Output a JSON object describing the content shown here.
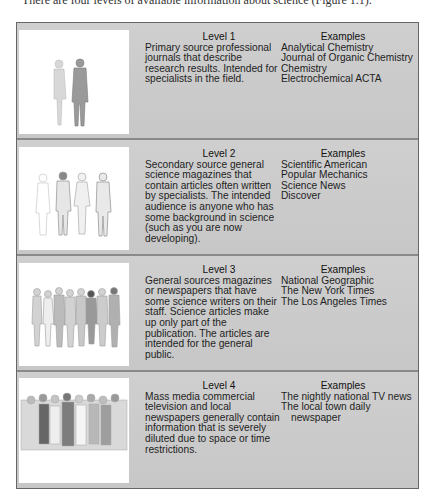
{
  "caption": "There are four levels of available information about science (Figure 1.1).",
  "figure": {
    "levels": [
      {
        "title": "Level 1",
        "description": "Primary source professional journals that describe research results. Intended for specialists in the field.",
        "description_lines": [
          "Primary source professional",
          "journals that describe",
          "research results. Intended for",
          "specialists in the field."
        ],
        "examples_heading": "Examples",
        "examples": [
          "Analytical Chemistry",
          "Journal of Organic Chemistry",
          "Chemistry",
          "Electrochemical ACTA"
        ],
        "illustration": "two-people-illustration"
      },
      {
        "title": "Level 2",
        "description": "Secondary source general science magazines that contain articles often written by specialists. The intended audience is anyone who has some background in science (such as you are now developing).",
        "description_lines": [
          "Secondary source general",
          "science magazines that",
          "contain articles often written",
          "by specialists. The intended",
          "audience is anyone who has",
          "some background in science",
          "(such as you are now",
          "developing)."
        ],
        "examples_heading": "Examples",
        "examples": [
          "Scientific American",
          "Popular Mechanics",
          "Science News",
          "Discover"
        ],
        "illustration": "four-people-illustration"
      },
      {
        "title": "Level 3",
        "description": "General sources magazines or newspapers that have some science writers on their staff. Science articles make up only part of the publication. The articles are intended for the general public.",
        "description_lines": [
          "General sources magazines",
          "or newspapers that have",
          "some science writers on their",
          "staff. Science articles make",
          "up only part of the",
          "publication. The articles are",
          "intended for the general",
          "public."
        ],
        "examples_heading": "Examples",
        "examples": [
          "National Geographic",
          "The New York Times",
          "The Los Angeles Times"
        ],
        "illustration": "group-of-people-illustration"
      },
      {
        "title": "Level 4",
        "description": "Mass media commercial television and local newspapers generally contain information that is severely diluted due to space or time restrictions.",
        "description_lines": [
          "Mass media commercial",
          "television and local",
          "newspapers generally contain",
          "information that is severely",
          "diluted due to space or time",
          "restrictions."
        ],
        "examples_heading": "Examples",
        "examples": [
          "The nightly national TV news",
          "The local town daily",
          "newspaper"
        ],
        "illustration": "crowd-illustration"
      }
    ]
  }
}
